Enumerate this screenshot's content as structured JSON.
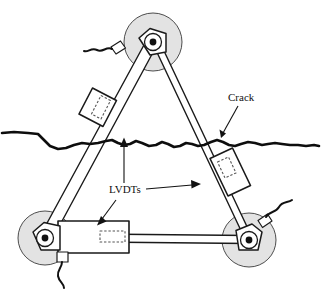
{
  "figure": {
    "title": "Crack measurement frame with LVDTs",
    "background_color": "#ffffff",
    "ink_color": "#111111",
    "wheel_fill_color": "#e3e3e3",
    "width": 321,
    "height": 291
  },
  "labels": {
    "crack": "Crack",
    "lvdts": "LVDTs"
  },
  "annotations": [
    {
      "name": "crack-label",
      "text": "Crack",
      "text_x": 228,
      "text_y": 101,
      "leader_from": [
        237,
        105
      ],
      "leader_to": [
        221,
        138
      ]
    },
    {
      "name": "lvdts-label",
      "text": "LVDTs",
      "text_x": 109,
      "text_y": 193,
      "leader_up_from": [
        124,
        183
      ],
      "leader_up_to": [
        124,
        140
      ],
      "leader_right_from": [
        146,
        189
      ],
      "leader_right_to": [
        196,
        184
      ],
      "leader_downleft_from": [
        117,
        199
      ],
      "leader_downleft_to": [
        99,
        223
      ]
    }
  ],
  "wheels": [
    {
      "name": "wheel-top",
      "cx": 153,
      "cy": 42,
      "r_tire": 29,
      "hub_dot_r": 3.4
    },
    {
      "name": "wheel-bottom-left",
      "cx": 45,
      "cy": 238,
      "r_tire": 27,
      "hub_dot_r": 3.4
    },
    {
      "name": "wheel-bottom-right",
      "cx": 249,
      "cy": 240,
      "r_tire": 27,
      "hub_dot_r": 3.4
    }
  ],
  "struts": [
    {
      "name": "strut-left",
      "from_wheel": "wheel-top",
      "to_wheel": "wheel-bottom-left"
    },
    {
      "name": "strut-right",
      "from_wheel": "wheel-top",
      "to_wheel": "wheel-bottom-right"
    },
    {
      "name": "strut-bottom",
      "from_wheel": "wheel-bottom-left",
      "to_wheel": "wheel-bottom-right"
    }
  ],
  "lvdts": [
    {
      "name": "lvdt-left",
      "mounted_on": "strut-left",
      "orientation": "diagonal"
    },
    {
      "name": "lvdt-right",
      "mounted_on": "strut-right",
      "orientation": "diagonal"
    },
    {
      "name": "lvdt-bottom",
      "mounted_on": "strut-bottom",
      "orientation": "horizontal"
    }
  ],
  "cables": [
    {
      "name": "cable-top-left",
      "attached_to": "wheel-top"
    },
    {
      "name": "cable-bottom-left",
      "attached_to": "wheel-bottom-left"
    },
    {
      "name": "cable-bottom-right",
      "attached_to": "wheel-bottom-right"
    }
  ],
  "crack": {
    "name": "crack-path",
    "description": "irregular wavy horizontal fracture line spanning full image width",
    "y_left": 133,
    "y_right": 146,
    "stroke_width": 2.6
  }
}
